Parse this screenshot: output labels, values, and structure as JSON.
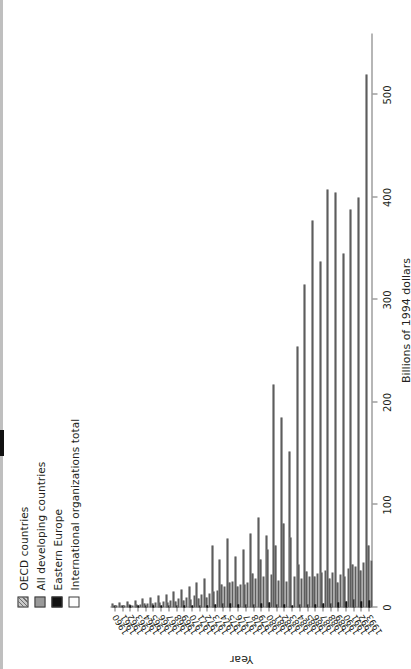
{
  "chart_data": {
    "type": "bar",
    "orientation": "horizontal",
    "title": "",
    "xlabel": "Billions of 1994 dollars",
    "ylabel": "Year",
    "xlim": [
      0,
      560
    ],
    "xticks": [
      0,
      100,
      200,
      300,
      400,
      500
    ],
    "xticklabels": [
      "0",
      "100",
      "200",
      "300",
      "400",
      "500"
    ],
    "grid": false,
    "legend_position": "top-left",
    "categories": [
      "1960",
      "1961",
      "1962",
      "1963",
      "1964",
      "1965",
      "1966",
      "1967",
      "1968",
      "1969",
      "1970",
      "1971",
      "1972",
      "1973",
      "1974",
      "1975",
      "1976",
      "1977",
      "1978",
      "1979",
      "1980",
      "1981",
      "1982",
      "1983",
      "1984",
      "1985",
      "1986",
      "1987",
      "1988",
      "1989",
      "1990",
      "1991",
      "1992",
      "1993"
    ],
    "series": [
      {
        "name": "OECD countries",
        "swatch": "hatched-gray",
        "color": "#cfcfcf",
        "values": [
          4,
          5,
          6,
          7,
          9,
          10,
          12,
          13,
          16,
          18,
          20,
          24,
          28,
          60,
          47,
          67,
          50,
          57,
          72,
          88,
          70,
          218,
          185,
          152,
          255,
          315,
          378,
          338,
          408,
          405,
          345,
          388,
          400,
          520
        ]
      },
      {
        "name": "All developing countries",
        "swatch": "solid-gray",
        "color": "#a4a4a4",
        "values": [
          2,
          2,
          3,
          3,
          4,
          4,
          5,
          5,
          6,
          7,
          8,
          9,
          10,
          16,
          22,
          24,
          20,
          22,
          33,
          47,
          57,
          60,
          82,
          68,
          42,
          35,
          30,
          34,
          28,
          24,
          30,
          42,
          36,
          60
        ]
      },
      {
        "name": "Eastern Europe",
        "swatch": "solid-black",
        "color": "#141414",
        "values": [
          1,
          1,
          1,
          1,
          1,
          1,
          1,
          1,
          1,
          1,
          2,
          2,
          2,
          3,
          4,
          4,
          3,
          3,
          3,
          4,
          5,
          3,
          3,
          2,
          3,
          3,
          3,
          4,
          4,
          5,
          6,
          8,
          6,
          7
        ]
      },
      {
        "name": "International organizations total",
        "swatch": "white",
        "color": "#fbfbfb",
        "values": [
          1,
          2,
          2,
          3,
          4,
          5,
          6,
          7,
          9,
          10,
          12,
          13,
          14,
          17,
          20,
          25,
          22,
          24,
          28,
          30,
          32,
          26,
          25,
          30,
          28,
          30,
          33,
          36,
          34,
          32,
          38,
          40,
          44,
          46
        ]
      }
    ]
  },
  "legend": {
    "items": [
      {
        "label": "OECD countries"
      },
      {
        "label": "All developing countries"
      },
      {
        "label": "Eastern Europe"
      },
      {
        "label": "International organizations total"
      }
    ]
  },
  "axes": {
    "value_axis_title": "Billions of 1994 dollars",
    "category_axis_title": "Year"
  }
}
